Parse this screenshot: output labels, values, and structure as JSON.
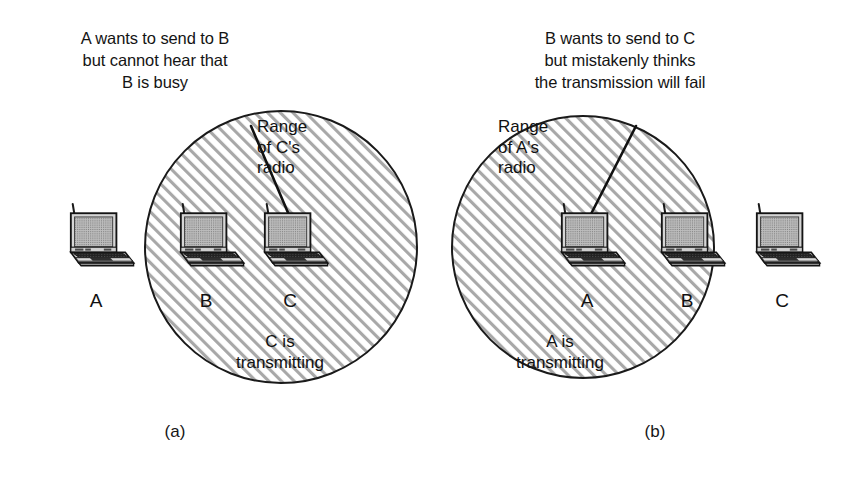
{
  "figure": {
    "type": "diagram",
    "panels": [
      {
        "id": "a",
        "label": "(a)",
        "caption": "A wants to send to B\nbut cannot hear that\nB is busy",
        "range_label": "Range\nof C's\nradio",
        "transmit_label": "C is\ntransmitting",
        "nodes": [
          {
            "letter": "A",
            "in_range": false
          },
          {
            "letter": "B",
            "in_range": true
          },
          {
            "letter": "C",
            "in_range": true
          }
        ]
      },
      {
        "id": "b",
        "label": "(b)",
        "caption": "B wants to send to C\nbut mistakenly thinks\nthe transmission will fail",
        "range_label": "Range\nof A's\nradio",
        "transmit_label": "A is\ntransmitting",
        "nodes": [
          {
            "letter": "A",
            "in_range": true
          },
          {
            "letter": "B",
            "in_range": true
          },
          {
            "letter": "C",
            "in_range": false
          }
        ]
      }
    ],
    "colors": {
      "background": "#ffffff",
      "ink": "#111111",
      "hatch": "#9a9a9a",
      "screen_fill": "#9e9e9e",
      "body_fill": "#d9d9d9",
      "keyboard_fill": "#2b2b2b",
      "outline": "#1a1a1a"
    }
  }
}
